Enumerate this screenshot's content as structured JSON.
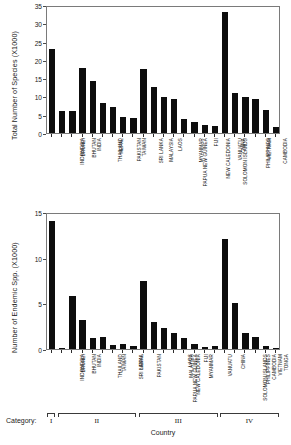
{
  "figure": {
    "category_axis_label": "Category:",
    "country_axis_label": "Country",
    "categories_roman": [
      "I",
      "II",
      "III",
      "IV"
    ]
  },
  "chart_data": [
    {
      "type": "bar",
      "title": "",
      "ylabel": "Total Number of Species (X1000)",
      "xlabel": "Country",
      "ylim": [
        0,
        35
      ],
      "yticks": [
        0,
        5,
        10,
        15,
        20,
        25,
        30,
        35
      ],
      "grid": false,
      "legend": "none",
      "bar_color": "#0d0d0d",
      "categories": [
        "INDONESIA",
        "BRUNEI",
        "BHUTAN",
        "INDIA",
        "THAILAND",
        "NEPAL",
        "PAKISTAN",
        "TAIWAN",
        "SRI LANKA",
        "MALAYSIA",
        "PAPUA NEW GUINEA",
        "LAOS",
        "MYANMAR",
        "NEW CALEDONIA",
        "SOLOMON ISLANDS",
        "FIJI",
        "VANUATU",
        "CHINA",
        "PHILIPPINES",
        "VIETNAM",
        "CAMBODIA",
        "BANGLADESH",
        "TONGA"
      ],
      "values": [
        23.0,
        6.1,
        5.9,
        17.7,
        14.3,
        8.3,
        7.1,
        4.3,
        4.2,
        17.6,
        12.7,
        9.8,
        9.3,
        3.9,
        3.0,
        2.1,
        2.0,
        33.0,
        11.0,
        9.9,
        9.3,
        6.4,
        1.6
      ]
    },
    {
      "type": "bar",
      "title": "",
      "ylabel": "Number of Endemic Spp. (X1000)",
      "xlabel": "Country",
      "ylim": [
        0,
        15
      ],
      "yticks": [
        0,
        5,
        10,
        15
      ],
      "grid": false,
      "legend": "none",
      "bar_color": "#0d0d0d",
      "categories": [
        "INDONESIA",
        "BRUNEI",
        "BHUTAN",
        "INDIA",
        "THAILAND",
        "TAIWAN",
        "SRI LANKA",
        "NEPAL",
        "PAKISTAN",
        "PAPUA NEW GUINEA",
        "NEW CALEDONIA",
        "MALAYSIA",
        "LAOS",
        "MYANMAR",
        "FIJI",
        "VANUATU",
        "SOLOMON ISLANDS",
        "CHINA",
        "PHILIPPINES",
        "CAMBODIA",
        "VIETNAM",
        "TONGA",
        "BANGLADESH"
      ],
      "values": [
        14.0,
        0.1,
        5.8,
        3.2,
        1.2,
        1.3,
        0.4,
        0.5,
        0.3,
        7.4,
        3.0,
        2.3,
        1.7,
        1.2,
        0.5,
        0.2,
        0.3,
        12.0,
        5.0,
        1.8,
        1.3,
        0.3,
        0.05
      ]
    }
  ],
  "category_groups": [
    {
      "roman": "I",
      "start_index": 0,
      "end_index": 0
    },
    {
      "roman": "II",
      "start_index": 1,
      "end_index": 8
    },
    {
      "roman": "III",
      "start_index": 9,
      "end_index": 16
    },
    {
      "roman": "IV",
      "start_index": 17,
      "end_index": 22
    }
  ]
}
